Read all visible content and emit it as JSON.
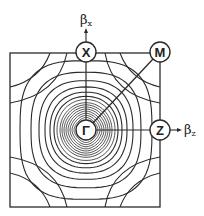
{
  "diagram": {
    "type": "brillouin-zone-contour-plot",
    "points": {
      "gamma": {
        "label": "Γ",
        "x": 86,
        "y": 130
      },
      "x": {
        "label": "X",
        "x": 86,
        "y": 52
      },
      "m": {
        "label": "M",
        "x": 160,
        "y": 52
      },
      "z": {
        "label": "Z",
        "x": 160,
        "y": 130
      }
    },
    "axes": {
      "vertical": {
        "label": "β",
        "subscript": "x"
      },
      "horizontal": {
        "label": "β",
        "subscript": "z"
      }
    },
    "box": {
      "x": 10,
      "y": 53,
      "width": 150,
      "height": 154
    },
    "colors": {
      "line": "#2a2a2a",
      "background": "#ffffff"
    }
  }
}
